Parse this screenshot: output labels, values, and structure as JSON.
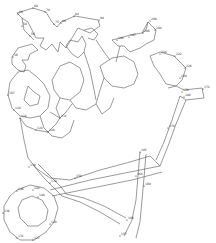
{
  "puzzle": {
    "type": "connect-the-dots",
    "subject": "flower basket",
    "line_color": "#555555",
    "background": "#ffffff",
    "sample_labels": [
      {
        "x": 33,
        "y": 8,
        "t": "68"
      },
      {
        "x": 45,
        "y": 12,
        "t": "70"
      },
      {
        "x": 18,
        "y": 14,
        "t": "60"
      },
      {
        "x": 22,
        "y": 26,
        "t": "58"
      },
      {
        "x": 30,
        "y": 36,
        "t": "56"
      },
      {
        "x": 54,
        "y": 24,
        "t": "75"
      },
      {
        "x": 61,
        "y": 23,
        "t": "80"
      },
      {
        "x": 74,
        "y": 16,
        "t": "84"
      },
      {
        "x": 99,
        "y": 20,
        "t": "90"
      },
      {
        "x": 150,
        "y": 21,
        "t": "208"
      },
      {
        "x": 155,
        "y": 30,
        "t": "204"
      },
      {
        "x": 143,
        "y": 33,
        "t": "200"
      },
      {
        "x": 129,
        "y": 37,
        "t": "197"
      },
      {
        "x": 117,
        "y": 40,
        "t": "194"
      },
      {
        "x": 160,
        "y": 54,
        "t": "218"
      },
      {
        "x": 175,
        "y": 56,
        "t": "222"
      },
      {
        "x": 185,
        "y": 68,
        "t": "226"
      },
      {
        "x": 180,
        "y": 78,
        "t": "229"
      },
      {
        "x": 13,
        "y": 57,
        "t": "36"
      },
      {
        "x": 8,
        "y": 95,
        "t": "107"
      },
      {
        "x": 14,
        "y": 110,
        "t": "110"
      },
      {
        "x": 20,
        "y": 118,
        "t": "114"
      },
      {
        "x": 36,
        "y": 130,
        "t": "124"
      },
      {
        "x": 48,
        "y": 132,
        "t": "128"
      },
      {
        "x": 60,
        "y": 118,
        "t": "131"
      },
      {
        "x": 182,
        "y": 92,
        "t": "176"
      },
      {
        "x": 203,
        "y": 89,
        "t": "172"
      },
      {
        "x": 184,
        "y": 97,
        "t": "180"
      },
      {
        "x": 168,
        "y": 128,
        "t": "170"
      },
      {
        "x": 140,
        "y": 152,
        "t": "185"
      },
      {
        "x": 136,
        "y": 176,
        "t": "164"
      },
      {
        "x": 29,
        "y": 167,
        "t": "139"
      },
      {
        "x": 50,
        "y": 183,
        "t": "178"
      },
      {
        "x": 75,
        "y": 178,
        "t": "150"
      },
      {
        "x": 17,
        "y": 191,
        "t": "146"
      },
      {
        "x": 33,
        "y": 190,
        "t": "142"
      },
      {
        "x": 38,
        "y": 197,
        "t": "148"
      },
      {
        "x": 3,
        "y": 213,
        "t": "136"
      },
      {
        "x": 17,
        "y": 238,
        "t": "131"
      },
      {
        "x": 33,
        "y": 240,
        "t": "127"
      },
      {
        "x": 50,
        "y": 224,
        "t": "120"
      },
      {
        "x": 127,
        "y": 220,
        "t": "160"
      },
      {
        "x": 120,
        "y": 236,
        "t": "157"
      },
      {
        "x": 144,
        "y": 186,
        "t": "169"
      }
    ]
  }
}
